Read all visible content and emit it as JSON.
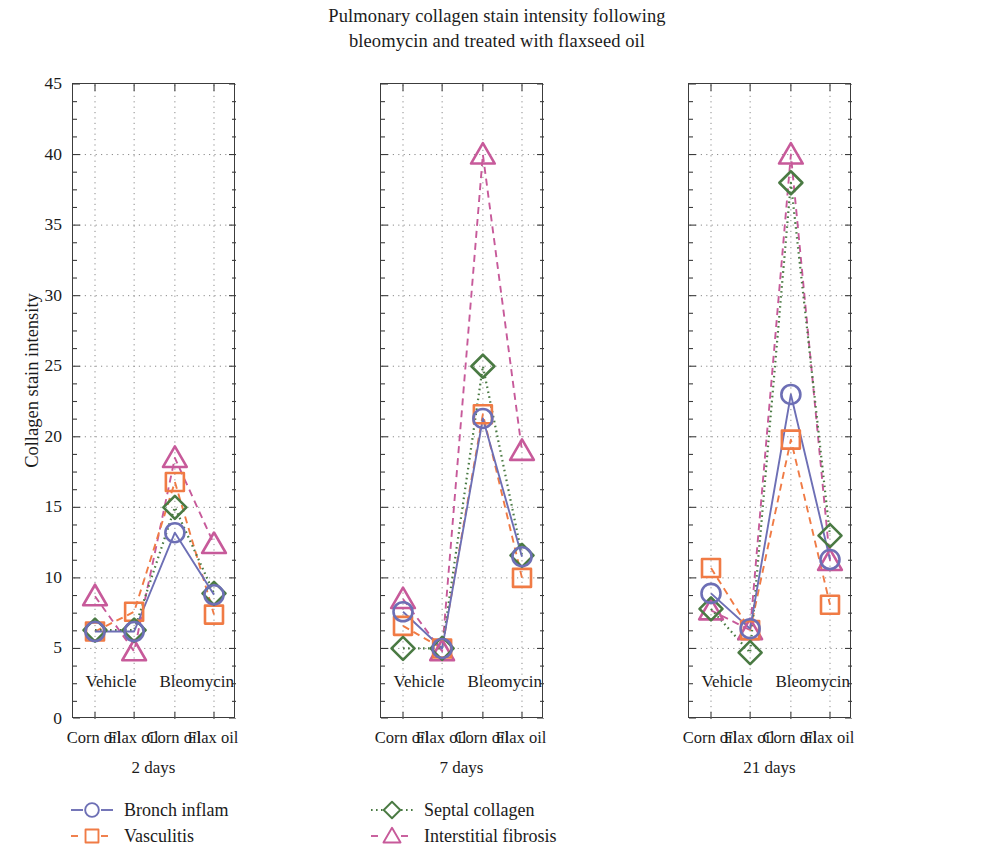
{
  "title": {
    "line1": "Pulmonary collagen stain intensity following",
    "line2": "bleomycin and treated with flaxseed oil"
  },
  "axes": {
    "ylabel": "Collagen stain intensity",
    "yticks": [
      "0",
      "5",
      "10",
      "15",
      "20",
      "25",
      "30",
      "35",
      "40",
      "45"
    ]
  },
  "panels": [
    {
      "group_label": "2 days",
      "xticks": [
        "Corn oil",
        "Flax oil",
        "Corn oil",
        "Flax oil"
      ],
      "inpanel_labels": [
        "Vehicle",
        "Bleomycin"
      ]
    },
    {
      "group_label": "7 days",
      "xticks": [
        "Corn oil",
        "Flax oil",
        "Corn oil",
        "Flax oil"
      ],
      "inpanel_labels": [
        "Vehicle",
        "Bleomycin"
      ]
    },
    {
      "group_label": "21 days",
      "xticks": [
        "Corn oil",
        "Flax oil",
        "Corn oil",
        "Flax oil"
      ],
      "inpanel_labels": [
        "Vehicle",
        "Bleomycin"
      ]
    }
  ],
  "legend": [
    {
      "label": "Bronch inflam",
      "marker": "circle-marker",
      "color": "#6d6fb5",
      "dash": "none"
    },
    {
      "label": "Vasculitis",
      "marker": "square-marker",
      "color": "#f07b45",
      "dash": "dashed"
    },
    {
      "label": "Septal collagen",
      "marker": "diamond-marker",
      "color": "#4a7a43",
      "dash": "dotted"
    },
    {
      "label": "Interstitial fibrosis",
      "marker": "triangle-marker",
      "color": "#c75a9a",
      "dash": "dashed"
    }
  ],
  "chart_data": {
    "type": "line",
    "title": "Pulmonary collagen stain intensity following bleomycin and treated with flaxseed oil",
    "xlabel": "",
    "ylabel": "Collagen stain intensity",
    "ylim": [
      0,
      45
    ],
    "ytick_step": 5,
    "grid": true,
    "legend_position": "bottom-left",
    "panels": [
      {
        "name": "2 days",
        "categories": [
          "Corn oil",
          "Flax oil",
          "Corn oil",
          "Flax oil"
        ],
        "category_groups": [
          "Vehicle",
          "Vehicle",
          "Bleomycin",
          "Bleomycin"
        ],
        "series": [
          {
            "name": "Bronch inflam",
            "values": [
              6.2,
              6.2,
              13.2,
              8.8
            ]
          },
          {
            "name": "Vasculitis",
            "values": [
              6.2,
              7.6,
              16.8,
              7.4
            ]
          },
          {
            "name": "Septal collagen",
            "values": [
              6.3,
              6.3,
              15.0,
              8.9
            ]
          },
          {
            "name": "Interstitial fibrosis",
            "values": [
              8.7,
              4.8,
              18.5,
              12.4
            ]
          }
        ]
      },
      {
        "name": "7 days",
        "categories": [
          "Corn oil",
          "Flax oil",
          "Corn oil",
          "Flax oil"
        ],
        "category_groups": [
          "Vehicle",
          "Vehicle",
          "Bleomycin",
          "Bleomycin"
        ],
        "series": [
          {
            "name": "Bronch inflam",
            "values": [
              7.6,
              5.0,
              21.3,
              11.5
            ]
          },
          {
            "name": "Vasculitis",
            "values": [
              6.6,
              5.0,
              21.6,
              10.0
            ]
          },
          {
            "name": "Septal collagen",
            "values": [
              5.0,
              5.0,
              25.0,
              11.6
            ]
          },
          {
            "name": "Interstitial fibrosis",
            "values": [
              8.5,
              4.8,
              40.0,
              19.0
            ]
          }
        ]
      },
      {
        "name": "21 days",
        "categories": [
          "Corn oil",
          "Flax oil",
          "Corn oil",
          "Flax oil"
        ],
        "category_groups": [
          "Vehicle",
          "Vehicle",
          "Bleomycin",
          "Bleomycin"
        ],
        "series": [
          {
            "name": "Bronch inflam",
            "values": [
              8.9,
              6.4,
              23.0,
              11.3
            ]
          },
          {
            "name": "Vasculitis",
            "values": [
              10.7,
              6.3,
              19.8,
              8.1
            ]
          },
          {
            "name": "Septal collagen",
            "values": [
              7.8,
              4.7,
              38.0,
              13.0
            ]
          },
          {
            "name": "Interstitial fibrosis",
            "values": [
              7.7,
              6.3,
              40.0,
              11.2
            ]
          }
        ]
      }
    ]
  }
}
